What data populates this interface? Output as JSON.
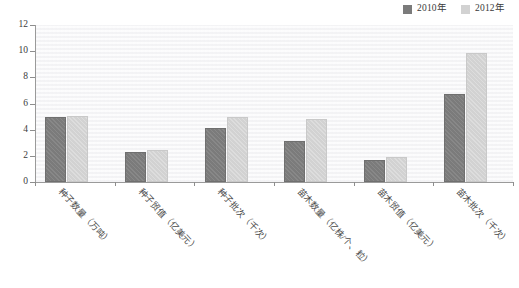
{
  "chart_data": {
    "type": "bar",
    "title": "",
    "subtitle": "",
    "xlabel": "",
    "ylabel": "",
    "ylim": [
      0,
      12
    ],
    "yticks": [
      0,
      2,
      4,
      6,
      8,
      10,
      12
    ],
    "grid": true,
    "legend_position": "top-right",
    "categories": [
      "种子数量（万吨）",
      "种子贸值（亿美元）",
      "种子批次（千次）",
      "苗木数量（亿株/个、粒）",
      "苗木贸值（亿美元）",
      "苗木批次（千次）"
    ],
    "series": [
      {
        "name": "2010年",
        "color": "#7b7b7b",
        "values": [
          5.0,
          2.3,
          4.1,
          3.1,
          1.7,
          6.75
        ]
      },
      {
        "name": "2012年",
        "color": "#d2d2d2",
        "values": [
          5.05,
          2.45,
          5.0,
          4.8,
          1.95,
          9.85
        ]
      }
    ]
  },
  "legend": {
    "items": [
      {
        "label": "2010年",
        "color": "#7b7b7b"
      },
      {
        "label": "2012年",
        "color": "#d2d2d2"
      }
    ]
  },
  "axes": {
    "y_tick_labels": [
      "12",
      "10",
      "8",
      "6",
      "4",
      "2",
      "0"
    ]
  }
}
